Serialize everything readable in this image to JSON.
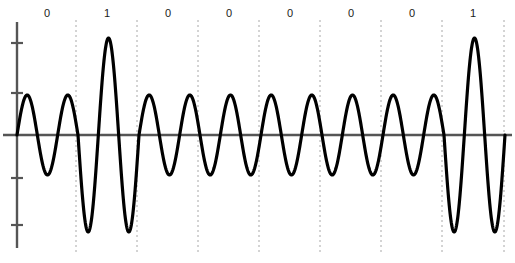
{
  "figure": {
    "name": "ask-modulation-waveform",
    "background_color": "#ffffff"
  },
  "colors": {
    "waveform": "#000000",
    "axis": "#555555",
    "divider": "#a8a8a8",
    "label": "#1a1a1a"
  },
  "axes": {
    "zero_line_y": 135,
    "y_axis_x": 17,
    "y_axis_top": 22,
    "y_axis_bottom": 248,
    "x_axis_left": 3,
    "x_axis_right": 512,
    "y_ticks": [
      43,
      93,
      178,
      225
    ],
    "tick_half_width": 6
  },
  "dividers": {
    "top": 20,
    "bottom": 253,
    "x_positions": [
      76,
      137,
      198,
      259,
      320,
      381,
      442,
      504
    ]
  },
  "labels": {
    "y": 14,
    "x_positions": [
      47,
      107,
      168,
      229,
      290,
      351,
      412,
      473
    ]
  },
  "chart_data": {
    "type": "line",
    "title": "",
    "xlabel": "",
    "ylabel": "",
    "modulation": "ASK",
    "bit_sequence": [
      "0",
      "1",
      "0",
      "0",
      "0",
      "0",
      "0",
      "1"
    ],
    "bit_count": 8,
    "segment_width_px": 61,
    "start_x_px": 17,
    "zero_level_px": 135,
    "amplitude_low_px": 40,
    "amplitude_high_px": 97,
    "cycles_per_bit": 1.5,
    "grid": false,
    "legend": false,
    "xlim": [
      17,
      505
    ],
    "ylim": [
      232,
      38
    ],
    "series": [
      {
        "name": "ask-signal",
        "amplitudes": [
          40,
          97,
          40,
          40,
          40,
          40,
          40,
          97
        ]
      }
    ]
  }
}
